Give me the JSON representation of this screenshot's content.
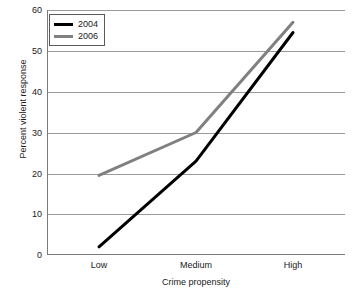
{
  "chart_data": {
    "type": "line",
    "title": "",
    "xlabel": "Crime propensity",
    "ylabel": "Percent violent response",
    "categories": [
      "Low",
      "Medium",
      "High"
    ],
    "series": [
      {
        "name": "2004",
        "color": "#000000",
        "values": [
          2,
          23,
          54.5
        ]
      },
      {
        "name": "2006",
        "color": "#808080",
        "values": [
          19.5,
          30,
          57
        ]
      }
    ],
    "ylim": [
      0,
      60
    ],
    "yticks": [
      0,
      10,
      20,
      30,
      40,
      50,
      60
    ],
    "ytick_labels": [
      "0",
      "10",
      "20",
      "30",
      "40",
      "50",
      "60"
    ],
    "grid": "horizontal",
    "legend_position": "top-left",
    "legend_entries": [
      "2004",
      "2006"
    ]
  },
  "axes": {
    "x_title": "Crime propensity",
    "y_title": "Percent violent response",
    "x_labels": [
      "Low",
      "Medium",
      "High"
    ],
    "y_labels": [
      "60",
      "50",
      "40",
      "30",
      "20",
      "10",
      "0"
    ]
  },
  "legend": {
    "items": [
      {
        "label": "2004",
        "color": "#000000"
      },
      {
        "label": "2006",
        "color": "#808080"
      }
    ]
  },
  "colors": {
    "series_2004": "#000000",
    "series_2006": "#808080",
    "gridline": "#9a9a9a",
    "axis": "#7a7a7a",
    "text": "#1a1a1a"
  }
}
